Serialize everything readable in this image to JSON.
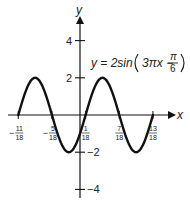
{
  "chart_data": {
    "type": "line",
    "title": "",
    "equation": "y = 2sin(3πx − π/6)",
    "equation_parts": {
      "lhs": "y = 2sin",
      "inner": "3πx −",
      "pi": "π",
      "den": "6"
    },
    "xlabel": "x",
    "ylabel": "y",
    "x_ticks": [
      {
        "value": -0.6111,
        "sign": "−",
        "num": "11",
        "den": "18"
      },
      {
        "value": -0.2778,
        "sign": "−",
        "num": "5",
        "den": "18"
      },
      {
        "value": 0.0556,
        "sign": "",
        "num": "1",
        "den": "18"
      },
      {
        "value": 0.3889,
        "sign": "",
        "num": "7",
        "den": "18"
      },
      {
        "value": 0.7222,
        "sign": "",
        "num": "13",
        "den": "18"
      }
    ],
    "y_ticks": [
      {
        "value": 4,
        "label": "4"
      },
      {
        "value": 2,
        "label": "2"
      },
      {
        "value": -2,
        "label": "−2"
      },
      {
        "value": -4,
        "label": "−4"
      }
    ],
    "series": [
      {
        "name": "y = 2sin(3πx − π/6)",
        "amplitude": 2,
        "frequency_coef": 3,
        "phase": -0.5236,
        "x_range": [
          -0.6111,
          0.7222
        ],
        "color": "#111111"
      }
    ],
    "xlim": [
      -0.68,
      0.85
    ],
    "ylim": [
      -4.4,
      5.2
    ],
    "grid": false,
    "legend": "none"
  }
}
